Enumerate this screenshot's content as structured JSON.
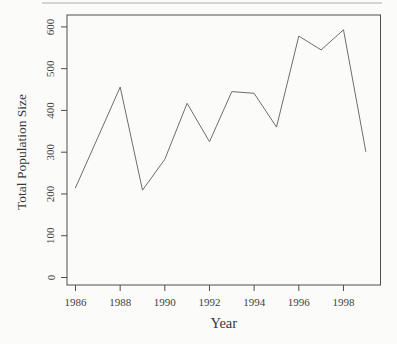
{
  "figure": {
    "title": "",
    "xlabel": "Year",
    "ylabel": "Total Population Size"
  },
  "chart_data": {
    "type": "line",
    "title": "",
    "xlabel": "Year",
    "ylabel": "Total Population Size",
    "x": [
      1986,
      1987,
      1988,
      1989,
      1990,
      1991,
      1992,
      1993,
      1994,
      1995,
      1996,
      1997,
      1998,
      1999
    ],
    "values": [
      215,
      335,
      456,
      209,
      283,
      417,
      325,
      445,
      441,
      360,
      578,
      545,
      593,
      302
    ],
    "series": [
      {
        "name": "Total Population Size",
        "values": [
          215,
          335,
          456,
          209,
          283,
          417,
          325,
          445,
          441,
          360,
          578,
          545,
          593,
          302
        ]
      }
    ],
    "xticks": [
      "1986",
      "1988",
      "1990",
      "1992",
      "1994",
      "1996",
      "1998"
    ],
    "yticks": [
      "0",
      "100",
      "200",
      "300",
      "400",
      "500",
      "600"
    ],
    "xlim": [
      1985.6,
      1999.7
    ],
    "ylim": [
      0,
      600
    ],
    "grid": false,
    "legend": "none",
    "style": "r-base-plot, open box frame, outward ticks, y tick labels rotated 90deg"
  },
  "colors": {
    "background": "#fbfbf9",
    "axis": "#4e4e4e",
    "tick_text": "#3f3f3f",
    "label_text": "#383838",
    "line": "#6e6e6e",
    "artifact": "#b5b5b5"
  }
}
